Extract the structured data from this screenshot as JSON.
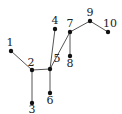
{
  "diagram": {
    "type": "tree",
    "nodes": [
      {
        "id": "1",
        "label": "1",
        "x": 11,
        "y": 51,
        "lx": 10,
        "ly": 46
      },
      {
        "id": "2",
        "label": "2",
        "x": 32,
        "y": 70,
        "lx": 31,
        "ly": 66
      },
      {
        "id": "3",
        "label": "3",
        "x": 32,
        "y": 103,
        "lx": 32,
        "ly": 113
      },
      {
        "id": "4",
        "label": "4",
        "x": 55,
        "y": 29,
        "lx": 55,
        "ly": 24
      },
      {
        "id": "5",
        "label": "5",
        "x": 50,
        "y": 69,
        "lx": 57,
        "ly": 62
      },
      {
        "id": "6",
        "label": "6",
        "x": 50,
        "y": 93,
        "lx": 50,
        "ly": 104
      },
      {
        "id": "7",
        "label": "7",
        "x": 70,
        "y": 32,
        "lx": 70,
        "ly": 27
      },
      {
        "id": "8",
        "label": "8",
        "x": 70,
        "y": 56,
        "lx": 70,
        "ly": 67
      },
      {
        "id": "9",
        "label": "9",
        "x": 90,
        "y": 21,
        "lx": 90,
        "ly": 16
      },
      {
        "id": "10",
        "label": "10",
        "x": 108,
        "y": 32,
        "lx": 110,
        "ly": 27
      }
    ],
    "edges": [
      [
        "1",
        "2"
      ],
      [
        "2",
        "3"
      ],
      [
        "2",
        "5"
      ],
      [
        "4",
        "5"
      ],
      [
        "5",
        "6"
      ],
      [
        "5",
        "7"
      ],
      [
        "7",
        "8"
      ],
      [
        "7",
        "9"
      ],
      [
        "9",
        "10"
      ]
    ],
    "colors": {
      "line": "#555555",
      "node": "#111111",
      "label": "#222222"
    }
  }
}
